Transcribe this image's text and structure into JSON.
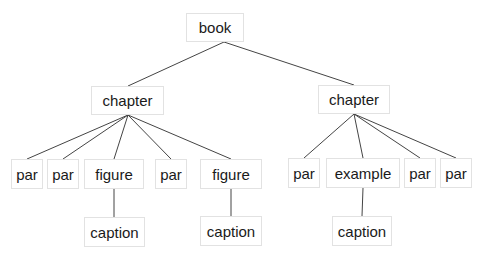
{
  "diagram": {
    "type": "tree",
    "colors": {
      "edge": "#444444",
      "node_border": "#e2e2e2",
      "text": "#1a1a1a",
      "background": "#ffffff"
    },
    "nodes": [
      {
        "id": "book",
        "label": "book",
        "x": 186,
        "y": 13,
        "w": 58,
        "h": 29
      },
      {
        "id": "chapter1",
        "label": "chapter",
        "x": 91,
        "y": 86,
        "w": 73,
        "h": 29
      },
      {
        "id": "chapter2",
        "label": "chapter",
        "x": 318,
        "y": 85,
        "w": 72,
        "h": 29
      },
      {
        "id": "par1",
        "label": "par",
        "x": 11,
        "y": 159,
        "w": 32,
        "h": 30
      },
      {
        "id": "par2",
        "label": "par",
        "x": 47,
        "y": 159,
        "w": 32,
        "h": 30
      },
      {
        "id": "figure1",
        "label": "figure",
        "x": 84,
        "y": 159,
        "w": 60,
        "h": 30
      },
      {
        "id": "par3",
        "label": "par",
        "x": 155,
        "y": 159,
        "w": 32,
        "h": 30
      },
      {
        "id": "figure2",
        "label": "figure",
        "x": 200,
        "y": 159,
        "w": 62,
        "h": 30
      },
      {
        "id": "par4",
        "label": "par",
        "x": 288,
        "y": 158,
        "w": 32,
        "h": 30
      },
      {
        "id": "example",
        "label": "example",
        "x": 326,
        "y": 158,
        "w": 74,
        "h": 30
      },
      {
        "id": "par5",
        "label": "par",
        "x": 404,
        "y": 158,
        "w": 32,
        "h": 30
      },
      {
        "id": "par6",
        "label": "par",
        "x": 440,
        "y": 158,
        "w": 32,
        "h": 30
      },
      {
        "id": "caption1",
        "label": "caption",
        "x": 84,
        "y": 217,
        "w": 61,
        "h": 30
      },
      {
        "id": "caption2",
        "label": "caption",
        "x": 200,
        "y": 216,
        "w": 62,
        "h": 30
      },
      {
        "id": "caption3",
        "label": "caption",
        "x": 332,
        "y": 216,
        "w": 60,
        "h": 30
      }
    ],
    "edges": [
      {
        "from": "book",
        "to": "chapter1",
        "x1": 224,
        "y1": 42,
        "x2": 128,
        "y2": 86
      },
      {
        "from": "book",
        "to": "chapter2",
        "x1": 224,
        "y1": 42,
        "x2": 354,
        "y2": 85
      },
      {
        "from": "chapter1",
        "to": "par1",
        "x1": 128,
        "y1": 115,
        "x2": 27,
        "y2": 159
      },
      {
        "from": "chapter1",
        "to": "par2",
        "x1": 128,
        "y1": 115,
        "x2": 63,
        "y2": 159
      },
      {
        "from": "chapter1",
        "to": "figure1",
        "x1": 128,
        "y1": 115,
        "x2": 114,
        "y2": 159
      },
      {
        "from": "chapter1",
        "to": "par3",
        "x1": 128,
        "y1": 115,
        "x2": 171,
        "y2": 159
      },
      {
        "from": "chapter1",
        "to": "figure2",
        "x1": 128,
        "y1": 115,
        "x2": 231,
        "y2": 159
      },
      {
        "from": "chapter2",
        "to": "par4",
        "x1": 354,
        "y1": 114,
        "x2": 304,
        "y2": 158
      },
      {
        "from": "chapter2",
        "to": "example",
        "x1": 354,
        "y1": 114,
        "x2": 363,
        "y2": 158
      },
      {
        "from": "chapter2",
        "to": "par5",
        "x1": 354,
        "y1": 114,
        "x2": 420,
        "y2": 158
      },
      {
        "from": "chapter2",
        "to": "par6",
        "x1": 354,
        "y1": 114,
        "x2": 456,
        "y2": 158
      },
      {
        "from": "figure1",
        "to": "caption1",
        "x1": 114,
        "y1": 189,
        "x2": 114,
        "y2": 217
      },
      {
        "from": "figure2",
        "to": "caption2",
        "x1": 231,
        "y1": 189,
        "x2": 231,
        "y2": 216
      },
      {
        "from": "example",
        "to": "caption3",
        "x1": 363,
        "y1": 188,
        "x2": 362,
        "y2": 216
      }
    ]
  }
}
